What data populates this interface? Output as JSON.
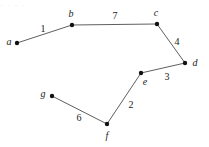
{
  "figure": {
    "kind": "weighted-graph-diagram",
    "width": 209,
    "height": 147,
    "background_color": "#ffffff",
    "edge_color": "#4d4d4d",
    "node_color": "#111111",
    "text_color": "#1a1a1a",
    "top_artifact_text": "· ·  · ·"
  },
  "graph": {
    "type": "undirected-weighted-path",
    "nodes": [
      {
        "id": "a",
        "label": "a",
        "x": 17,
        "y": 43,
        "label_x": 9,
        "label_y": 42
      },
      {
        "id": "b",
        "label": "b",
        "x": 72,
        "y": 25,
        "label_x": 71,
        "label_y": 14
      },
      {
        "id": "c",
        "label": "c",
        "x": 157,
        "y": 24,
        "label_x": 156,
        "label_y": 13
      },
      {
        "id": "d",
        "label": "d",
        "x": 185,
        "y": 63,
        "label_x": 195,
        "label_y": 63
      },
      {
        "id": "e",
        "label": "e",
        "x": 141,
        "y": 73,
        "label_x": 145,
        "label_y": 82
      },
      {
        "id": "f",
        "label": "f",
        "x": 107,
        "y": 124,
        "label_x": 107,
        "label_y": 136
      },
      {
        "id": "g",
        "label": "g",
        "x": 52,
        "y": 96,
        "label_x": 43,
        "label_y": 94
      }
    ],
    "edges": [
      {
        "id": "a-b",
        "from": "a",
        "to": "b",
        "weight": "1",
        "label_x": 43,
        "label_y": 29
      },
      {
        "id": "b-c",
        "from": "b",
        "to": "c",
        "weight": "7",
        "label_x": 115,
        "label_y": 16
      },
      {
        "id": "c-d",
        "from": "c",
        "to": "d",
        "weight": "4",
        "label_x": 177,
        "label_y": 42
      },
      {
        "id": "d-e",
        "from": "d",
        "to": "e",
        "weight": "3",
        "label_x": 167,
        "label_y": 77
      },
      {
        "id": "e-f",
        "from": "e",
        "to": "f",
        "weight": "2",
        "label_x": 131,
        "label_y": 105
      },
      {
        "id": "f-g",
        "from": "f",
        "to": "g",
        "weight": "6",
        "label_x": 79,
        "label_y": 118
      }
    ]
  }
}
